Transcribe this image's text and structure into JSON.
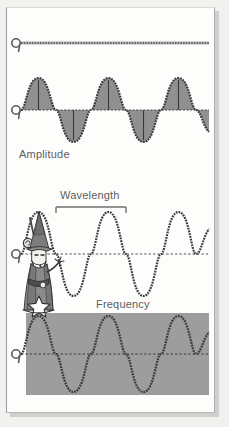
{
  "diagram": {
    "title_hidden": "",
    "panels": [
      {
        "id": "flat",
        "label": "",
        "wave_type": "flat-line",
        "description": "straight horizontal dashed baseline with origin marker"
      },
      {
        "id": "amplitude",
        "label": "Amplitude",
        "wave_type": "filled-sine",
        "cycles": 2.75,
        "description": "gray filled sine wave with vertical amplitude indicator lines"
      },
      {
        "id": "wavelength",
        "label": "Wavelength",
        "wave_type": "outline-sine",
        "cycles": 2.75,
        "description": "outline sine wave with peak-to-peak wavelength measuring bar"
      },
      {
        "id": "frequency",
        "label": "Frequency",
        "wave_type": "outline-sine-on-gray",
        "cycles": 2.75,
        "description": "outline sine wave over solid gray background box"
      }
    ],
    "character": {
      "name": "wizard",
      "description": "cartoon wizard with pointed hat, staff and star"
    },
    "colors": {
      "page_background": "#f2f1ef",
      "card_background": "#fdfdfc",
      "wave_stroke": "#3b3b3b",
      "wave_fill": "#8e8e8e",
      "frequency_box": "#9d9d9d",
      "label_text": "#5d5d5d",
      "axis_dash": "#555555"
    }
  }
}
